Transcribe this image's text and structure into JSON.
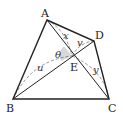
{
  "diagram": {
    "type": "quadrilateral-with-diagonals",
    "points": {
      "A": {
        "label": "A",
        "x": 47,
        "y": 20
      },
      "B": {
        "label": "B",
        "x": 13,
        "y": 99
      },
      "C": {
        "label": "C",
        "x": 109,
        "y": 99
      },
      "D": {
        "label": "D",
        "x": 94,
        "y": 41
      },
      "E": {
        "label": "E",
        "x": 72,
        "y": 56
      }
    },
    "segment_labels": {
      "x": "x",
      "v": "v",
      "u": "u",
      "y": "y"
    },
    "angle_label": "θ",
    "colors": {
      "line": "#222222",
      "dashed": "#777777",
      "shade": "#c8c8c8"
    }
  }
}
